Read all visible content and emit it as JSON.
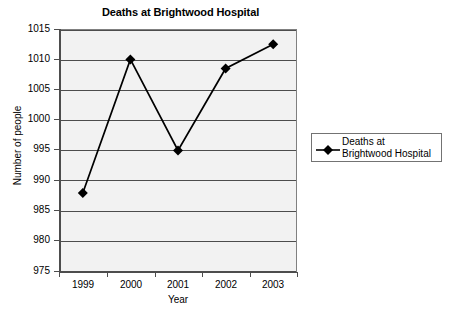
{
  "chart_data": {
    "type": "line",
    "title": "Deaths at Brightwood Hospital",
    "xlabel": "Year",
    "ylabel": "Number of people",
    "categories": [
      "1999",
      "2000",
      "2001",
      "2002",
      "2003"
    ],
    "values": [
      988,
      1010,
      995,
      1008.5,
      1012.5
    ],
    "series": [
      {
        "name": "Deaths at Brightwood Hospital",
        "values": [
          988,
          1010,
          995,
          1008.5,
          1012.5
        ]
      }
    ],
    "ylim": [
      975,
      1015
    ],
    "yticks": [
      1015,
      1010,
      1005,
      1000,
      995,
      990,
      985,
      980,
      975
    ],
    "ytick_labels": [
      "1015",
      "1010",
      "1005",
      "1000",
      "995",
      "990",
      "985",
      "980",
      "975"
    ],
    "xtick_labels": [
      "1999",
      "2000",
      "2001",
      "2002",
      "2003"
    ],
    "grid": "horizontal",
    "legend_position": "right",
    "marker": "diamond",
    "colors": {
      "line": "#000000",
      "marker": "#000000",
      "plot_background": "#f2f2f2",
      "gridline": "#4d4d4d",
      "axis": "#4d4d4d",
      "text": "#000000",
      "legend_border": "#737373",
      "page_background": "#ffffff"
    }
  },
  "legend": {
    "entries": [
      {
        "label": "Deaths at\nBrightwood Hospital",
        "marker": "diamond-line-marker"
      }
    ]
  }
}
